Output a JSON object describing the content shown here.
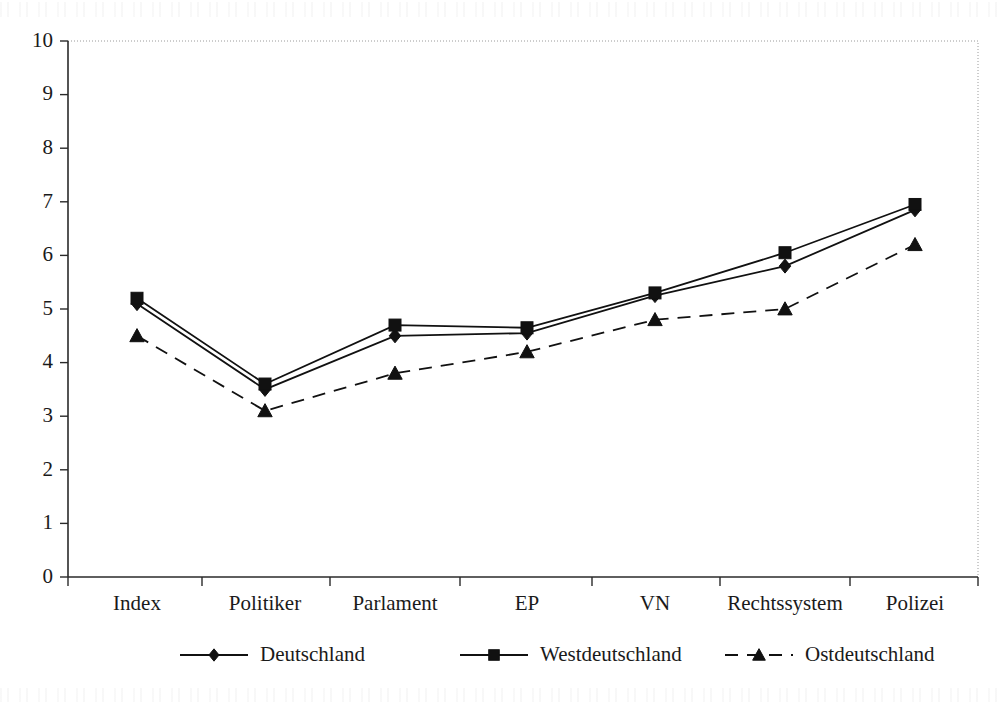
{
  "chart_data": {
    "type": "line",
    "title": "",
    "subtitle": "",
    "xlabel": "",
    "ylabel": "",
    "categories": [
      "Index",
      "Politiker",
      "Parlament",
      "EP",
      "VN",
      "Rechtssystem",
      "Polizei"
    ],
    "series": [
      {
        "name": "Deutschland",
        "marker": "diamond",
        "linestyle": "solid",
        "color": "#111111",
        "values": [
          5.1,
          3.5,
          4.5,
          4.55,
          5.25,
          5.8,
          6.85
        ]
      },
      {
        "name": "Westdeutschland",
        "marker": "square",
        "linestyle": "solid",
        "color": "#111111",
        "values": [
          5.2,
          3.6,
          4.7,
          4.65,
          5.3,
          6.05,
          6.95
        ]
      },
      {
        "name": "Ostdeutschland",
        "marker": "triangle",
        "linestyle": "dashed",
        "color": "#111111",
        "values": [
          4.5,
          3.1,
          3.8,
          4.2,
          4.8,
          5.0,
          6.2
        ]
      }
    ],
    "ylim": [
      0,
      10
    ],
    "yticks": [
      0,
      1,
      2,
      3,
      4,
      5,
      6,
      7,
      8,
      9,
      10
    ],
    "ytick_labels": [
      "0",
      "1",
      "2",
      "3",
      "4",
      "5",
      "6",
      "7",
      "8",
      "9",
      "10"
    ],
    "grid": false,
    "legend_position": "bottom"
  },
  "legend": {
    "entries": [
      {
        "label": "Deutschland",
        "marker": "diamond",
        "linestyle": "solid"
      },
      {
        "label": "Westdeutschland",
        "marker": "square",
        "linestyle": "solid"
      },
      {
        "label": "Ostdeutschland",
        "marker": "triangle",
        "linestyle": "dashed"
      }
    ]
  }
}
